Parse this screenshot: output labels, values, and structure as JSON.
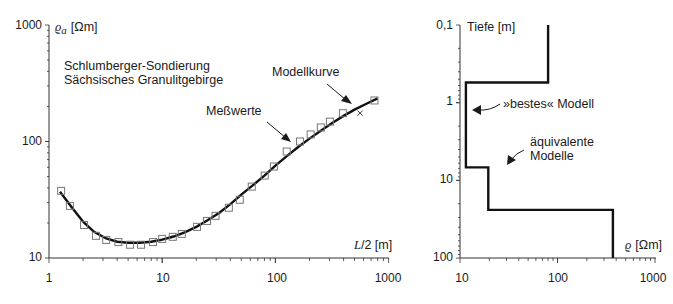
{
  "chart_data": [
    {
      "type": "scatter",
      "title": "Schlumberger-Sondierung Sächsisches Granulitgebirge",
      "title_lines": [
        "Schlumberger-Sondierung",
        "Sächsisches Granulitgebirge"
      ],
      "xlabel": "L/2 [m]",
      "ylabel": "ϱa [Ωm]",
      "xscale": "log",
      "yscale": "log",
      "xlim": [
        1,
        1000
      ],
      "ylim": [
        10,
        1000
      ],
      "xticks": [
        "1",
        "10",
        "100",
        "1000"
      ],
      "yticks": [
        "10",
        "100",
        "1000"
      ],
      "grid": false,
      "annotations": [
        {
          "text": "Meßwerte",
          "points_to": "measured data squares"
        },
        {
          "text": "Modellkurve",
          "points_to": "model curve"
        }
      ],
      "series": [
        {
          "name": "Meßwerte",
          "marker": "square",
          "x": [
            1.28,
            1.53,
            2.04,
            2.6,
            3.2,
            4.1,
            5.2,
            6.5,
            8.3,
            10,
            12.4,
            14.9,
            20.3,
            24.9,
            29.6,
            38.8,
            48.5,
            61.8,
            80.5,
            97,
            126,
            165,
            205,
            252,
            303,
            395,
            750
          ],
          "y": [
            37.7,
            28,
            19.2,
            15.5,
            14.3,
            13.7,
            13,
            13,
            13.7,
            14.6,
            15.2,
            16.1,
            18.5,
            20.8,
            23,
            27,
            31.6,
            41,
            51,
            61,
            82,
            100,
            115,
            132,
            148,
            175,
            225
          ]
        },
        {
          "name": "outlier",
          "marker": "x",
          "x": [
            560
          ],
          "y": [
            175
          ]
        },
        {
          "name": "Modellkurve",
          "type": "line",
          "x": [
            1.25,
            1.6,
            2,
            2.5,
            3.2,
            4,
            5,
            6.3,
            8,
            10,
            12.6,
            16,
            20,
            25,
            32,
            40,
            50,
            63,
            80,
            100,
            126,
            160,
            200,
            250,
            320,
            400,
            500,
            630,
            800
          ],
          "y": [
            37,
            27,
            20.5,
            16.8,
            14.7,
            13.8,
            13.5,
            13.5,
            13.8,
            14.4,
            15.3,
            16.7,
            18.5,
            21,
            24.5,
            29,
            35,
            42,
            51,
            62,
            75,
            90,
            106,
            123,
            145,
            166,
            188,
            210,
            235
          ]
        }
      ]
    },
    {
      "type": "line",
      "title": "",
      "xlabel": "ϱ [Ωm]",
      "ylabel": "Tiefe [m]",
      "xscale": "log",
      "yscale": "log",
      "y_inverted": true,
      "xlim": [
        10,
        1000
      ],
      "ylim": [
        0.1,
        100
      ],
      "xticks": [
        "10",
        "100",
        "1000"
      ],
      "yticks": [
        "0,1",
        "1",
        "10",
        "100"
      ],
      "grid": false,
      "annotations": [
        {
          "text": "»bestes« Modell",
          "points_to": "layer model line"
        },
        {
          "text": "äquivalente Modelle",
          "lines": [
            "äquivalente",
            "Modelle"
          ]
        }
      ],
      "series": [
        {
          "name": "»bestes« Modell",
          "layers": [
            {
              "rho": 80,
              "top": 0.1,
              "bottom": 0.55
            },
            {
              "rho": 11.5,
              "top": 0.55,
              "bottom": 6.8
            },
            {
              "rho": 19.5,
              "top": 6.8,
              "bottom": 24
            },
            {
              "rho": 370,
              "top": 24,
              "bottom": 100
            }
          ]
        }
      ]
    }
  ],
  "left": {
    "title1": "Schlumberger-Sondierung",
    "title2": "Sächsisches Granulitgebirge",
    "ylabel_sym": "ϱ",
    "ylabel_sub": "a",
    "ylabel_unit": "[Ωm]",
    "xlabel_sym": "L",
    "xlabel_rest": "/2 [m]",
    "ann_mess": "Meßwerte",
    "ann_modell": "Modellkurve",
    "yticks": [
      "1000",
      "100",
      "10"
    ],
    "xticks": [
      "1",
      "10",
      "100",
      "1000"
    ]
  },
  "right": {
    "ylabel": "Tiefe [m]",
    "xlabel_sym": "ϱ",
    "xlabel_unit": "[Ωm]",
    "ann_best": "»bestes« Modell",
    "ann_aeq1": "äquivalente",
    "ann_aeq2": "Modelle",
    "yticks": [
      "0,1",
      "1",
      "10",
      "100"
    ],
    "xticks": [
      "10",
      "100",
      "1000"
    ]
  },
  "colors": {
    "ink": "#1a1a1a",
    "marker": "#777777",
    "axis": "#333333"
  }
}
